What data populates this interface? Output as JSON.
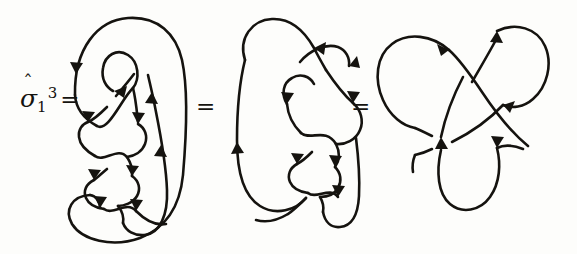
{
  "figure": {
    "kind": "knot-diagram",
    "background_color": "#fdfdfb",
    "ink_color": "#15130f",
    "width": 577,
    "height": 254
  },
  "label": {
    "symbol": "σ",
    "hat": "ˆ",
    "subscript": "1",
    "superscript": "3",
    "equals": "=",
    "full_text": "σ̂1³ ="
  },
  "equals_signs": [
    {
      "id": "eq-1",
      "text": "="
    },
    {
      "id": "eq-2",
      "text": "="
    }
  ],
  "diagrams": [
    {
      "name": "braid-closure",
      "title": "closure of braid sigma-1 cubed",
      "crossings": 3,
      "arrowheads": 8
    },
    {
      "name": "intermediate-trefoil",
      "title": "partially simplified trefoil",
      "crossings": 3,
      "arrowheads": 7
    },
    {
      "name": "standard-trefoil",
      "title": "standard three-fold symmetric trefoil",
      "crossings": 3,
      "arrowheads": 4
    }
  ]
}
